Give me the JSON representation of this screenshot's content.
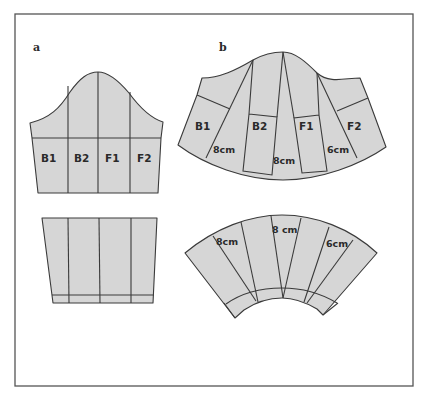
{
  "figure": {
    "frame_color": "#555555",
    "piece_fill": "#d6d6d6",
    "line_color": "#3a3a3a"
  },
  "panels": {
    "a": {
      "label": "a",
      "sections": [
        "B1",
        "B2",
        "F1",
        "F2"
      ]
    },
    "b": {
      "label": "b",
      "sections": [
        "B1",
        "B2",
        "F1",
        "F2"
      ],
      "spread_top": [
        "8cm",
        "8cm",
        "6cm"
      ],
      "spread_bottom": [
        "8cm",
        "8 cm",
        "6cm"
      ]
    }
  }
}
